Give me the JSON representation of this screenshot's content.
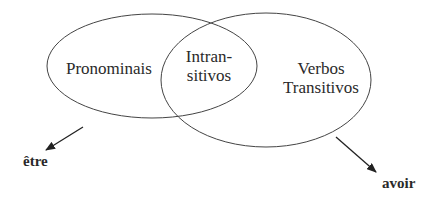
{
  "diagram": {
    "type": "venn",
    "sets": [
      {
        "id": "left",
        "label": "Pronominais"
      },
      {
        "id": "right",
        "label_lines": [
          "Verbos",
          "Transitivos"
        ]
      }
    ],
    "intersection": {
      "label_lines": [
        "Intran-",
        "sitivos"
      ]
    },
    "arrows": [
      {
        "from": "left",
        "target_label": "être"
      },
      {
        "from": "right",
        "target_label": "avoir"
      }
    ],
    "colors": {
      "stroke": "#444444",
      "text": "#2a2a2a",
      "background": "#ffffff"
    }
  }
}
